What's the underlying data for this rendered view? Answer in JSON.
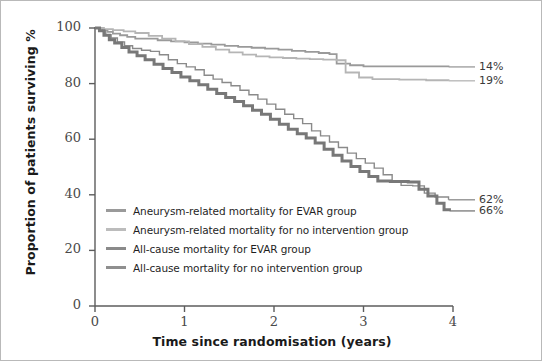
{
  "chart_data": {
    "type": "line",
    "title": "",
    "xlabel": "Time since randomisation (years)",
    "ylabel": "Proportion of patients surviving %",
    "xlim": [
      0,
      4
    ],
    "ylim": [
      0,
      100
    ],
    "xticks": [
      "0",
      "1",
      "2",
      "3",
      "4"
    ],
    "yticks": [
      "0",
      "20",
      "40",
      "60",
      "80",
      "100"
    ],
    "grid": false,
    "legend_position": "inside-lower-left",
    "series": [
      {
        "name": "Aneurysm-related mortality for EVAR group",
        "color": "#9a9a9a",
        "width": 1.8,
        "end_label": "14%",
        "end_value": 86,
        "points": [
          [
            0.0,
            100
          ],
          [
            0.05,
            100
          ],
          [
            0.08,
            99.3
          ],
          [
            0.14,
            98.6
          ],
          [
            0.2,
            98.0
          ],
          [
            0.28,
            97.4
          ],
          [
            0.36,
            96.8
          ],
          [
            0.45,
            96.2
          ],
          [
            0.55,
            96.2
          ],
          [
            0.7,
            95.6
          ],
          [
            0.85,
            95.2
          ],
          [
            1.0,
            94.8
          ],
          [
            1.15,
            94.4
          ],
          [
            1.3,
            94.0
          ],
          [
            1.45,
            93.6
          ],
          [
            1.6,
            93.2
          ],
          [
            1.75,
            92.9
          ],
          [
            1.9,
            92.6
          ],
          [
            2.05,
            92.2
          ],
          [
            2.2,
            91.8
          ],
          [
            2.35,
            91.4
          ],
          [
            2.5,
            91.0
          ],
          [
            2.62,
            90.6
          ],
          [
            2.7,
            87.2
          ],
          [
            2.85,
            86.6
          ],
          [
            3.0,
            86.2
          ],
          [
            3.3,
            86.2
          ],
          [
            3.6,
            86.2
          ],
          [
            3.95,
            86.0
          ]
        ]
      },
      {
        "name": "Aneurysm-related mortality for no intervention group",
        "color": "#b5b5b5",
        "width": 1.8,
        "end_label": "19%",
        "end_value": 81,
        "points": [
          [
            0.0,
            100
          ],
          [
            0.1,
            99.6
          ],
          [
            0.2,
            99.2
          ],
          [
            0.32,
            98.8
          ],
          [
            0.45,
            98.2
          ],
          [
            0.6,
            97.2
          ],
          [
            0.75,
            96.2
          ],
          [
            0.9,
            95.2
          ],
          [
            1.05,
            94.2
          ],
          [
            1.2,
            93.2
          ],
          [
            1.35,
            92.2
          ],
          [
            1.5,
            91.2
          ],
          [
            1.65,
            90.4
          ],
          [
            1.8,
            89.8
          ],
          [
            1.95,
            89.4
          ],
          [
            2.1,
            89.2
          ],
          [
            2.25,
            89.0
          ],
          [
            2.4,
            88.8
          ],
          [
            2.55,
            88.6
          ],
          [
            2.7,
            88.4
          ],
          [
            2.8,
            84.0
          ],
          [
            2.95,
            82.2
          ],
          [
            3.1,
            81.6
          ],
          [
            3.4,
            81.4
          ],
          [
            3.7,
            81.2
          ],
          [
            3.95,
            81.0
          ]
        ]
      },
      {
        "name": "All-cause mortality for EVAR group",
        "color": "#8a8a8a",
        "width": 1.4,
        "end_label": "62%",
        "end_value": 38,
        "points": [
          [
            0.0,
            100
          ],
          [
            0.06,
            99.0
          ],
          [
            0.12,
            97.6
          ],
          [
            0.18,
            96.4
          ],
          [
            0.25,
            95.0
          ],
          [
            0.33,
            93.6
          ],
          [
            0.42,
            92.6
          ],
          [
            0.52,
            92.0
          ],
          [
            0.62,
            91.6
          ],
          [
            0.72,
            90.4
          ],
          [
            0.82,
            88.6
          ],
          [
            0.92,
            87.2
          ],
          [
            1.02,
            86.0
          ],
          [
            1.12,
            85.0
          ],
          [
            1.22,
            83.0
          ],
          [
            1.32,
            81.6
          ],
          [
            1.42,
            80.4
          ],
          [
            1.52,
            79.2
          ],
          [
            1.62,
            77.6
          ],
          [
            1.72,
            76.0
          ],
          [
            1.82,
            74.4
          ],
          [
            1.92,
            72.6
          ],
          [
            2.02,
            70.8
          ],
          [
            2.12,
            69.0
          ],
          [
            2.22,
            67.4
          ],
          [
            2.32,
            65.6
          ],
          [
            2.42,
            63.0
          ],
          [
            2.52,
            61.2
          ],
          [
            2.62,
            59.0
          ],
          [
            2.72,
            57.0
          ],
          [
            2.82,
            55.0
          ],
          [
            2.92,
            53.0
          ],
          [
            3.02,
            51.4
          ],
          [
            3.12,
            49.6
          ],
          [
            3.22,
            47.2
          ],
          [
            3.32,
            44.8
          ],
          [
            3.42,
            43.4
          ],
          [
            3.55,
            43.2
          ],
          [
            3.68,
            40.6
          ],
          [
            3.8,
            39.2
          ],
          [
            3.95,
            38.2
          ]
        ]
      },
      {
        "name": "All-cause mortality for no intervention group",
        "color": "#787878",
        "width": 3.0,
        "end_label": "66%",
        "end_value": 34,
        "points": [
          [
            0.0,
            100
          ],
          [
            0.05,
            99.0
          ],
          [
            0.1,
            97.4
          ],
          [
            0.16,
            95.8
          ],
          [
            0.22,
            94.6
          ],
          [
            0.3,
            93.0
          ],
          [
            0.38,
            91.4
          ],
          [
            0.47,
            90.0
          ],
          [
            0.56,
            88.6
          ],
          [
            0.66,
            87.0
          ],
          [
            0.76,
            85.4
          ],
          [
            0.86,
            84.0
          ],
          [
            0.96,
            82.4
          ],
          [
            1.06,
            81.0
          ],
          [
            1.16,
            79.6
          ],
          [
            1.26,
            78.0
          ],
          [
            1.36,
            76.4
          ],
          [
            1.46,
            75.0
          ],
          [
            1.56,
            73.6
          ],
          [
            1.66,
            72.0
          ],
          [
            1.76,
            70.4
          ],
          [
            1.86,
            69.0
          ],
          [
            1.96,
            67.2
          ],
          [
            2.06,
            65.4
          ],
          [
            2.16,
            63.6
          ],
          [
            2.26,
            62.0
          ],
          [
            2.36,
            60.4
          ],
          [
            2.46,
            58.6
          ],
          [
            2.56,
            56.4
          ],
          [
            2.66,
            54.2
          ],
          [
            2.76,
            52.2
          ],
          [
            2.86,
            50.2
          ],
          [
            2.96,
            48.4
          ],
          [
            3.06,
            46.6
          ],
          [
            3.16,
            45.0
          ],
          [
            3.3,
            44.8
          ],
          [
            3.5,
            44.6
          ],
          [
            3.62,
            42.0
          ],
          [
            3.72,
            39.6
          ],
          [
            3.82,
            37.0
          ],
          [
            3.9,
            34.6
          ],
          [
            3.96,
            34.2
          ]
        ]
      }
    ]
  },
  "axis": {
    "y_title": "Proportion of patients surviving %",
    "x_title": "Time since randomisation (years)",
    "y_ticks": [
      "100",
      "80",
      "60",
      "40",
      "20",
      "0"
    ],
    "x_ticks": [
      "0",
      "1",
      "2",
      "3",
      "4"
    ]
  },
  "end_labels": [
    {
      "text": "14%"
    },
    {
      "text": "19%"
    },
    {
      "text": "62%"
    },
    {
      "text": "66%"
    }
  ],
  "legend": {
    "items": [
      {
        "label": "Aneurysm-related mortality for EVAR group",
        "color": "#9a9a9a",
        "thickness": "3px"
      },
      {
        "label": "Aneurysm-related mortality for no intervention group",
        "color": "#bcbcbc",
        "thickness": "3px"
      },
      {
        "label": "All-cause mortality for EVAR group",
        "color": "#8a8a8a",
        "thickness": "3px"
      },
      {
        "label": "All-cause mortality for no intervention group",
        "color": "#8f8f8f",
        "thickness": "3px"
      }
    ]
  }
}
